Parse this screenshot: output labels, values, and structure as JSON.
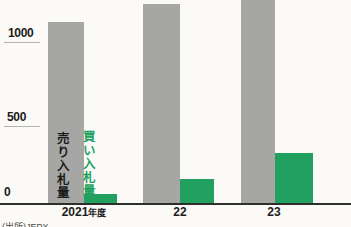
{
  "chart_data": {
    "type": "bar",
    "categories": [
      "2021年度",
      "22",
      "23"
    ],
    "series": [
      {
        "name": "売り入札量",
        "color": "#a6a6a4",
        "values": [
          1110,
          1220,
          1250
        ]
      },
      {
        "name": "買い入札量",
        "color": "#22a05f",
        "values": [
          60,
          150,
          310
        ]
      }
    ],
    "yticks": [
      "0",
      "500",
      "1000"
    ],
    "ylim": [
      0,
      1245
    ],
    "grid": false,
    "legend_position": "inside-left-vertical",
    "source": "(出所)JEPX"
  },
  "labels": {
    "ytick_1000": "1000",
    "ytick_500": "500",
    "ytick_0": "0",
    "category_2021_main": "2021",
    "category_2021_suffix": "年度",
    "category_22": "22",
    "category_23": "23",
    "legend_sell": "売り入札量",
    "legend_buy": "買い入札量",
    "source": "(出所)JEPX"
  },
  "colors": {
    "sell_bar": "#a6a6a4",
    "buy_bar": "#22a05f",
    "axis": "#2e2e2c",
    "background": "#fbfaf7",
    "text": "#1d1d1b"
  },
  "scale": {
    "px_per_500_units": 82,
    "axis_y_px": 204,
    "max_bar_px": 204
  }
}
